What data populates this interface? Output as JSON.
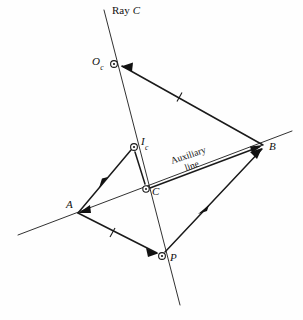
{
  "figure": {
    "kind": "geometry-diagram",
    "background_color": "#fefefe",
    "stroke_color": "#1a1a1a",
    "width": 303,
    "height": 320
  },
  "labels": {
    "ray_c_word": "Ray",
    "ray_c_letter": "C",
    "ray_c_full": "Ray C",
    "point_o_main": "O",
    "point_o_sub": "c",
    "point_i_main": "I",
    "point_i_sub": "c",
    "point_c": "C",
    "point_a": "A",
    "point_b": "B",
    "point_p": "P",
    "auxiliary_line_1": "Auxiliary",
    "auxiliary_line_2": "line"
  },
  "points": {
    "O_c": {
      "name": "O_c",
      "x": 114,
      "y": 64,
      "marker": "open-circle-dot"
    },
    "I_c": {
      "name": "I_c",
      "x": 134,
      "y": 147,
      "marker": "open-circle-dot"
    },
    "C": {
      "name": "C",
      "x": 146,
      "y": 189,
      "marker": "open-circle-dot"
    },
    "A": {
      "name": "A",
      "x": 78,
      "y": 213,
      "marker": "arrow-junction"
    },
    "B": {
      "name": "B",
      "x": 263,
      "y": 145,
      "marker": "arrow-junction"
    },
    "P": {
      "name": "P",
      "x": 162,
      "y": 256,
      "marker": "open-circle-dot"
    }
  },
  "lines": {
    "ray_c": {
      "name": "Ray C",
      "from": [
        104,
        10
      ],
      "to": [
        180,
        305
      ],
      "style": "thin"
    },
    "auxiliary": {
      "name": "Auxiliary line",
      "from": [
        18,
        235
      ],
      "to": [
        292,
        131
      ],
      "style": "thin"
    }
  },
  "segments": [
    {
      "name": "B-to-Oc",
      "from": "B",
      "to": "O_c",
      "marker": "tick",
      "arrow_at_end": true
    },
    {
      "name": "A-to-Ic",
      "from": "A",
      "to": "I_c",
      "marker": "mid-arrow",
      "arrow_at_end": false
    },
    {
      "name": "Ic-to-C",
      "from": "I_c",
      "to": "C",
      "marker": "none",
      "arrow_at_end": false
    },
    {
      "name": "A-to-P",
      "from": "A",
      "to": "P",
      "marker": "tick",
      "arrow_at_end": true
    },
    {
      "name": "P-to-B",
      "from": "P",
      "to": "B",
      "marker": "mid-arrow",
      "arrow_at_end": true
    },
    {
      "name": "C-to-B",
      "from": "C",
      "to": "B",
      "marker": "none",
      "arrow_at_end": false
    },
    {
      "name": "A-to-C-aux",
      "from": "A",
      "to": "C",
      "marker": "none",
      "arrow_at_end": false
    }
  ]
}
